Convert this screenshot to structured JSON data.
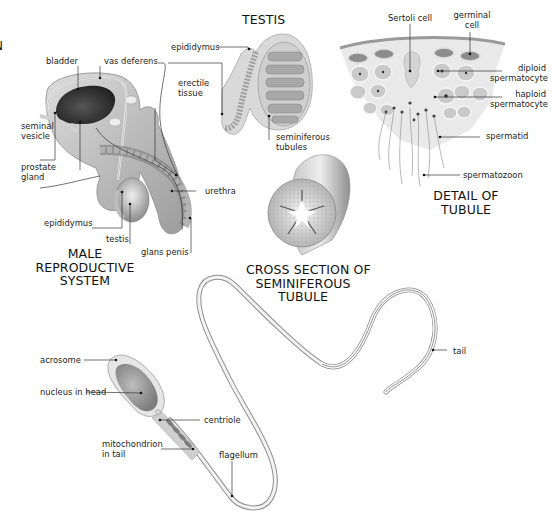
{
  "cutoff_letter": "N",
  "male_system": {
    "title": [
      "MALE",
      "REPRODUCTIVE",
      "SYSTEM"
    ],
    "labels": {
      "bladder": "bladder",
      "vas_deferens": "vas deferens",
      "seminal_vesicle": [
        "seminal",
        "vesicle"
      ],
      "prostate_gland": [
        "prostate",
        "gland"
      ],
      "epididymus": "epididymus",
      "testis": "testis",
      "erectile_tissue": [
        "erectile",
        "tissue"
      ],
      "urethra": "urethra",
      "glans_penis": "glans penis"
    }
  },
  "testis": {
    "title": "TESTIS",
    "labels": {
      "epididymus": "epididymus",
      "seminiferous_tubules": [
        "seminiferous",
        "tubules"
      ]
    }
  },
  "tubule_detail": {
    "title": [
      "DETAIL OF",
      "TUBULE"
    ],
    "labels": {
      "sertoli_cell": "Sertoli cell",
      "germinal_cell": [
        "germinal",
        "cell"
      ],
      "diploid_spermatocyte": [
        "diploid",
        "spermatocyte"
      ],
      "haploid_spermatocyte": [
        "haploid",
        "spermatocyte"
      ],
      "spermatid": "spermatid",
      "spermatozoon": "spermatozoon"
    }
  },
  "cross_section": {
    "title": [
      "CROSS SECTION OF",
      "SEMINIFEROUS",
      "TUBULE"
    ]
  },
  "sperm": {
    "labels": {
      "acrosome": "acrosome",
      "nucleus_in_head": "nucleus in head",
      "centriole": "centriole",
      "mitochondrion_in_tail": [
        "mitochondrion",
        "in tail"
      ],
      "flagellum": "flagellum",
      "tail": "tail"
    }
  },
  "colors": {
    "leader_line": "#333333",
    "tissue_dark": "#6f6f6f",
    "tissue_mid": "#a9a9a9",
    "tissue_light": "#d6d6d6",
    "background": "#ffffff"
  }
}
